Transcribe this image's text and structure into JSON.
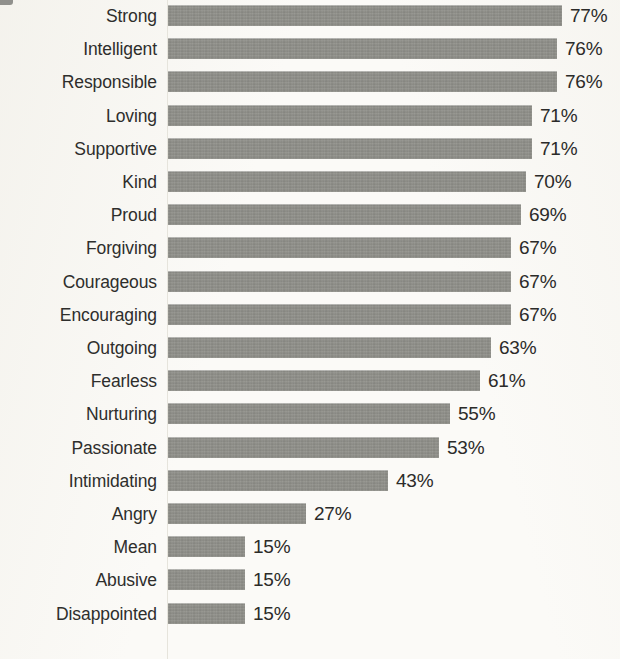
{
  "chart_data": {
    "type": "bar",
    "orientation": "horizontal",
    "title": "",
    "subtitle": "",
    "xlabel": "",
    "ylabel": "",
    "grid": false,
    "legend": null,
    "value_suffix": "%",
    "xlim": [
      0,
      77
    ],
    "axis_ticks": [],
    "categories": [
      "Strong",
      "Intelligent",
      "Responsible",
      "Loving",
      "Supportive",
      "Kind",
      "Proud",
      "Forgiving",
      "Courageous",
      "Encouraging",
      "Outgoing",
      "Fearless",
      "Nurturing",
      "Passionate",
      "Intimidating",
      "Angry",
      "Mean",
      "Abusive",
      "Disappointed"
    ],
    "values": [
      77,
      76,
      76,
      71,
      71,
      70,
      69,
      67,
      67,
      67,
      63,
      61,
      55,
      53,
      43,
      27,
      15,
      15,
      15
    ],
    "value_labels": [
      "77%",
      "76%",
      "76%",
      "71%",
      "71%",
      "70%",
      "69%",
      "67%",
      "67%",
      "67%",
      "63%",
      "61%",
      "55%",
      "53%",
      "43%",
      "27%",
      "15%",
      "15%",
      "15%"
    ],
    "bar_color": "#8d8d87",
    "label_color": "#2e2e2c",
    "value_color": "#2b2b29",
    "background_color": "#fbfaf7"
  },
  "layout": {
    "bar_origin_x": 168,
    "px_per_percent": 5.12,
    "row_pitch": 33.2,
    "first_row_top": 4,
    "bar_height": 21,
    "value_gap": 8
  }
}
